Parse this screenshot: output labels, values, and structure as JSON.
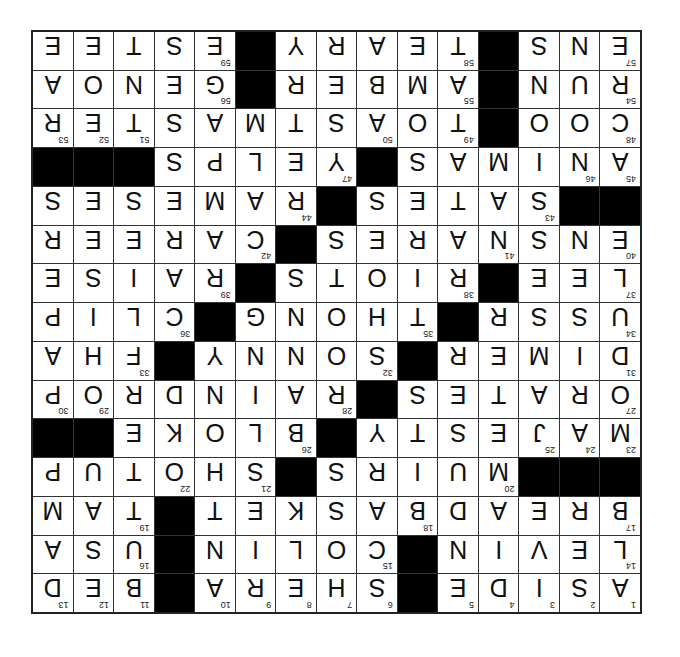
{
  "colors": {
    "background": "#ffffff",
    "cell": "#ffffff",
    "block": "#000000",
    "line": "#333333",
    "frame": "#222222"
  },
  "puzzle": {
    "row_count": 15,
    "col_count": 15,
    "display_rotation_deg": 180,
    "rows": [
      {
        "letters": [
          "A",
          "S",
          "I",
          "D",
          "E",
          "#",
          "S",
          "H",
          "E",
          "R",
          "A",
          "#",
          "B",
          "E",
          "D"
        ],
        "numbers": [
          "1",
          "2",
          "3",
          "4",
          "5",
          "",
          "6",
          "7",
          "8",
          "9",
          "10",
          "",
          "11",
          "12",
          "13"
        ]
      },
      {
        "letters": [
          "L",
          "E",
          "V",
          "I",
          "N",
          "#",
          "C",
          "O",
          "L",
          "I",
          "N",
          "#",
          "U",
          "S",
          "A"
        ],
        "numbers": [
          "14",
          "",
          "",
          "",
          "",
          "",
          "15",
          "",
          "",
          "",
          "",
          "",
          "16",
          "",
          ""
        ]
      },
      {
        "letters": [
          "B",
          "R",
          "E",
          "A",
          "D",
          "B",
          "A",
          "S",
          "K",
          "E",
          "T",
          "#",
          "T",
          "A",
          "M"
        ],
        "numbers": [
          "17",
          "",
          "",
          "",
          "",
          "18",
          "",
          "",
          "",
          "",
          "",
          "",
          "19",
          "",
          ""
        ]
      },
      {
        "letters": [
          "#",
          "#",
          "#",
          "M",
          "U",
          "I",
          "R",
          "S",
          "#",
          "S",
          "H",
          "O",
          "T",
          "U",
          "P"
        ],
        "numbers": [
          "",
          "",
          "",
          "20",
          "",
          "",
          "",
          "",
          "",
          "21",
          "",
          "22",
          "",
          "",
          ""
        ]
      },
      {
        "letters": [
          "M",
          "A",
          "J",
          "E",
          "S",
          "T",
          "Y",
          "#",
          "B",
          "L",
          "O",
          "K",
          "E",
          "#",
          "#"
        ],
        "numbers": [
          "23",
          "24",
          "25",
          "",
          "",
          "",
          "",
          "",
          "26",
          "",
          "",
          "",
          "",
          "",
          ""
        ]
      },
      {
        "letters": [
          "O",
          "R",
          "A",
          "T",
          "E",
          "S",
          "#",
          "R",
          "A",
          "I",
          "N",
          "D",
          "R",
          "O",
          "P"
        ],
        "numbers": [
          "27",
          "",
          "",
          "",
          "",
          "",
          "",
          "28",
          "",
          "",
          "",
          "",
          "",
          "29",
          "30"
        ]
      },
      {
        "letters": [
          "D",
          "I",
          "M",
          "E",
          "R",
          "#",
          "S",
          "O",
          "N",
          "N",
          "Y",
          "#",
          "F",
          "H",
          "A"
        ],
        "numbers": [
          "31",
          "",
          "",
          "",
          "",
          "",
          "32",
          "",
          "",
          "",
          "",
          "",
          "33",
          "",
          ""
        ]
      },
      {
        "letters": [
          "U",
          "S",
          "S",
          "R",
          "#",
          "T",
          "H",
          "O",
          "N",
          "G",
          "#",
          "C",
          "L",
          "I",
          "P"
        ],
        "numbers": [
          "34",
          "",
          "",
          "",
          "",
          "35",
          "",
          "",
          "",
          "",
          "",
          "36",
          "",
          "",
          ""
        ]
      },
      {
        "letters": [
          "L",
          "E",
          "E",
          "#",
          "R",
          "I",
          "O",
          "T",
          "S",
          "#",
          "R",
          "A",
          "I",
          "S",
          "E"
        ],
        "numbers": [
          "37",
          "",
          "",
          "",
          "38",
          "",
          "",
          "",
          "",
          "",
          "39",
          "",
          "",
          "",
          ""
        ]
      },
      {
        "letters": [
          "E",
          "N",
          "S",
          "N",
          "A",
          "R",
          "E",
          "S",
          "#",
          "C",
          "A",
          "R",
          "E",
          "E",
          "R"
        ],
        "numbers": [
          "40",
          "",
          "",
          "41",
          "",
          "",
          "",
          "",
          "",
          "42",
          "",
          "",
          "",
          "",
          ""
        ]
      },
      {
        "letters": [
          "#",
          "#",
          "S",
          "A",
          "T",
          "E",
          "S",
          "#",
          "R",
          "A",
          "M",
          "E",
          "S",
          "E",
          "S"
        ],
        "numbers": [
          "",
          "",
          "43",
          "",
          "",
          "",
          "",
          "",
          "44",
          "",
          "",
          "",
          "",
          "",
          ""
        ]
      },
      {
        "letters": [
          "A",
          "N",
          "I",
          "M",
          "A",
          "S",
          "#",
          "Y",
          "E",
          "L",
          "P",
          "S",
          "#",
          "#",
          "#"
        ],
        "numbers": [
          "45",
          "46",
          "",
          "",
          "",
          "",
          "",
          "47",
          "",
          "",
          "",
          "",
          "",
          "",
          ""
        ]
      },
      {
        "letters": [
          "C",
          "O",
          "O",
          "#",
          "T",
          "O",
          "A",
          "S",
          "T",
          "M",
          "A",
          "S",
          "T",
          "E",
          "R"
        ],
        "numbers": [
          "48",
          "",
          "",
          "",
          "49",
          "",
          "50",
          "",
          "",
          "",
          "",
          "",
          "51",
          "52",
          "53"
        ]
      },
      {
        "letters": [
          "R",
          "U",
          "N",
          "#",
          "A",
          "M",
          "B",
          "E",
          "R",
          "#",
          "G",
          "E",
          "N",
          "O",
          "A"
        ],
        "numbers": [
          "54",
          "",
          "",
          "",
          "55",
          "",
          "",
          "",
          "",
          "",
          "56",
          "",
          "",
          "",
          ""
        ]
      },
      {
        "letters": [
          "E",
          "N",
          "S",
          "#",
          "T",
          "E",
          "A",
          "R",
          "Y",
          "#",
          "E",
          "S",
          "T",
          "E",
          "E"
        ],
        "numbers": [
          "57",
          "",
          "",
          "",
          "58",
          "",
          "",
          "",
          "",
          "",
          "59",
          "",
          "",
          "",
          ""
        ]
      }
    ]
  }
}
